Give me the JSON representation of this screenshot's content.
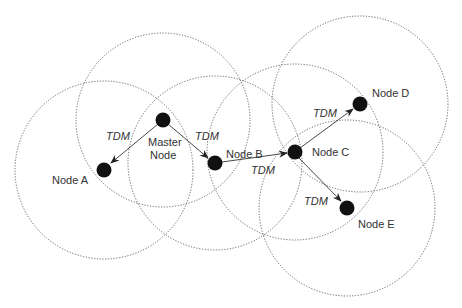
{
  "diagram": {
    "type": "wireless-network-tdm",
    "nodes": [
      {
        "id": "master",
        "label_lines": [
          "Master",
          "Node"
        ],
        "x": 163,
        "y": 120,
        "range_r": 87
      },
      {
        "id": "a",
        "label_lines": [
          "Node  A"
        ],
        "x": 104,
        "y": 170,
        "range_r": 89
      },
      {
        "id": "b",
        "label_lines": [
          "Node  B"
        ],
        "x": 215,
        "y": 163,
        "range_r": 87
      },
      {
        "id": "c",
        "label_lines": [
          "Node  C"
        ],
        "x": 295,
        "y": 152,
        "range_r": 88
      },
      {
        "id": "d",
        "label_lines": [
          "Node  D"
        ],
        "x": 360,
        "y": 104,
        "range_r": 88
      },
      {
        "id": "e",
        "label_lines": [
          "Node  E"
        ],
        "x": 347,
        "y": 208,
        "range_r": 88
      }
    ],
    "links": [
      {
        "from": "master",
        "to": "a",
        "label": "TDM"
      },
      {
        "from": "master",
        "to": "b",
        "label": "TDM"
      },
      {
        "from": "b",
        "to": "c",
        "label": "TDM"
      },
      {
        "from": "c",
        "to": "d",
        "label": "TDM"
      },
      {
        "from": "c",
        "to": "e",
        "label": "TDM"
      }
    ],
    "labels": {
      "master_line1": "Master",
      "master_line2": "Node",
      "node_a": "Node  A",
      "node_b": "Node  B",
      "node_c": "Node  C",
      "node_d": "Node  D",
      "node_e": "Node  E",
      "tdm_master_a": "TDM",
      "tdm_master_b": "TDM",
      "tdm_b_c": "TDM",
      "tdm_c_d": "TDM",
      "tdm_c_e": "TDM"
    },
    "colors": {
      "node_fill": "#111111",
      "range_stroke": "#555555",
      "text": "#333333"
    }
  }
}
